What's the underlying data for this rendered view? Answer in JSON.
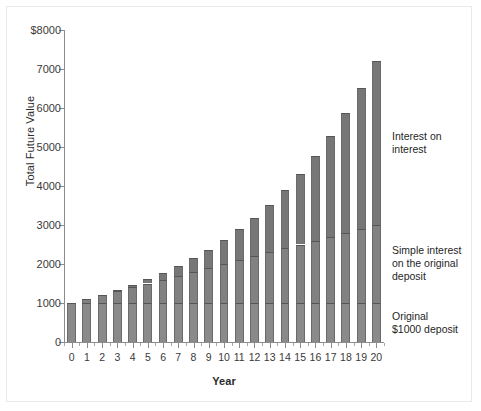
{
  "chart_data": {
    "type": "bar",
    "title": "",
    "xlabel": "Year",
    "ylabel": "Total Future Value",
    "ylim": [
      0,
      8000
    ],
    "ytick_labels": [
      "0",
      "1000",
      "2000",
      "3000",
      "4000",
      "5000",
      "6000",
      "7000",
      "$8000"
    ],
    "ytick_values": [
      0,
      1000,
      2000,
      3000,
      4000,
      5000,
      6000,
      7000,
      8000
    ],
    "grid": false,
    "legend_position": "right-annotations",
    "stacked": true,
    "categories": [
      "0",
      "1",
      "2",
      "3",
      "4",
      "5",
      "6",
      "7",
      "8",
      "9",
      "10",
      "11",
      "12",
      "13",
      "14",
      "15",
      "16",
      "17",
      "18",
      "19",
      "20"
    ],
    "series": [
      {
        "name": "Original $1000 deposit",
        "values": [
          1000,
          1000,
          1000,
          1000,
          1000,
          1000,
          1000,
          1000,
          1000,
          1000,
          1000,
          1000,
          1000,
          1000,
          1000,
          1000,
          1000,
          1000,
          1000,
          1000,
          1000
        ]
      },
      {
        "name": "Simple interest on the original deposit",
        "values": [
          0,
          100,
          200,
          300,
          400,
          500,
          600,
          700,
          800,
          900,
          1000,
          1100,
          1200,
          1300,
          1400,
          1500,
          1600,
          1700,
          1800,
          1900,
          2000
        ]
      },
      {
        "name": "Interest on interest",
        "values": [
          0,
          0,
          10,
          31,
          64,
          110,
          172,
          251,
          349,
          469,
          614,
          785,
          988,
          1224,
          1498,
          1815,
          2178,
          2594,
          3067,
          3604,
          4210
        ]
      }
    ],
    "totals": [
      1000,
      1100,
      1210,
      1331,
      1464,
      1610,
      1772,
      1949,
      2144,
      2359,
      2594,
      2885,
      3188,
      3524,
      3898,
      4315,
      4778,
      5294,
      5867,
      6504,
      7210
    ],
    "annotations": [
      {
        "text": "Interest on interest",
        "target_series": "Interest on interest"
      },
      {
        "text": "Simple interest on the original deposit",
        "target_series": "Simple interest on the original deposit"
      },
      {
        "text": "Original $1000 deposit",
        "target_series": "Original $1000 deposit"
      }
    ],
    "colors": {
      "bar_fill": "#7e7e7e",
      "bar_edge": "#555555",
      "axis": "#8c8c8c",
      "text": "#2b2b2b",
      "background": "#ffffff"
    }
  },
  "annotation_text": {
    "interest_on_interest": "Interest on\ninterest",
    "simple_interest": "Simple interest\non the original\ndeposit",
    "original_deposit": "Original\n$1000 deposit"
  }
}
